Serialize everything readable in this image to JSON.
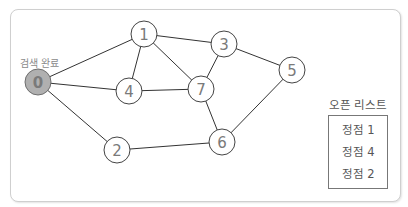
{
  "diagram": {
    "nodes": [
      {
        "id": "0",
        "x": 38,
        "y": 82,
        "state": "visited"
      },
      {
        "id": "1",
        "x": 144,
        "y": 34,
        "state": "unvisited"
      },
      {
        "id": "2",
        "x": 117,
        "y": 150,
        "state": "unvisited"
      },
      {
        "id": "3",
        "x": 224,
        "y": 44,
        "state": "unvisited"
      },
      {
        "id": "4",
        "x": 129,
        "y": 91,
        "state": "unvisited"
      },
      {
        "id": "5",
        "x": 292,
        "y": 70,
        "state": "unvisited"
      },
      {
        "id": "6",
        "x": 222,
        "y": 142,
        "state": "unvisited"
      },
      {
        "id": "7",
        "x": 201,
        "y": 89,
        "state": "unvisited"
      }
    ],
    "edges": [
      [
        "0",
        "1"
      ],
      [
        "0",
        "4"
      ],
      [
        "0",
        "2"
      ],
      [
        "1",
        "3"
      ],
      [
        "1",
        "4"
      ],
      [
        "1",
        "7"
      ],
      [
        "4",
        "7"
      ],
      [
        "3",
        "7"
      ],
      [
        "3",
        "5"
      ],
      [
        "7",
        "6"
      ],
      [
        "5",
        "6"
      ],
      [
        "2",
        "6"
      ]
    ],
    "visited_node_label": "검색 완료",
    "colors": {
      "visited_fill": "#b0b0b0",
      "visited_stroke": "#6e6e6e",
      "node_stroke": "#444444",
      "edge": "#333333",
      "text": "#7a7a7a"
    }
  },
  "open_list": {
    "title": "오픈 리스트",
    "items": [
      "정점 1",
      "정점 4",
      "정점 2"
    ]
  }
}
